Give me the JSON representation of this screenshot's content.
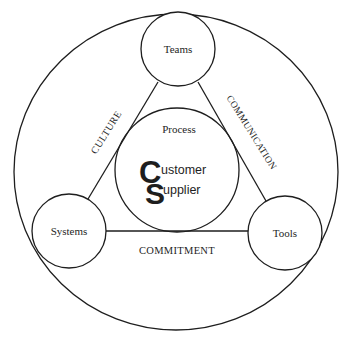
{
  "diagram": {
    "outer_circle": {
      "label": ""
    },
    "center": {
      "label": "Process",
      "logo": {
        "big_c": "C",
        "big_s": "S",
        "line1": "ustomer",
        "line2": "upplier"
      }
    },
    "nodes": [
      {
        "id": "teams",
        "label": "Teams"
      },
      {
        "id": "systems",
        "label": "Systems"
      },
      {
        "id": "tools",
        "label": "Tools"
      }
    ],
    "edges": [
      {
        "from": "teams",
        "to": "systems",
        "label": "CULTURE"
      },
      {
        "from": "teams",
        "to": "tools",
        "label": "COMMUNICATION"
      },
      {
        "from": "systems",
        "to": "tools",
        "label": "COMMITMENT"
      }
    ],
    "colors": {
      "line": "#1e1e1e",
      "background": "#ffffff"
    }
  }
}
